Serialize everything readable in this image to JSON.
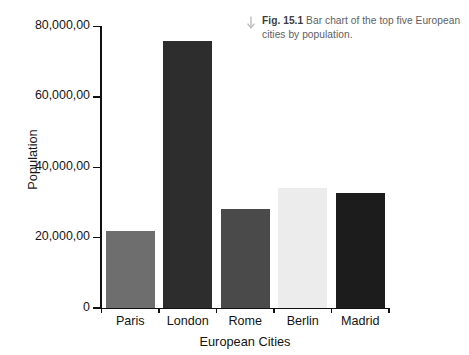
{
  "caption": {
    "icon": "down-arrow-icon",
    "label": "Fig. 15.1",
    "text": " Bar chart of the top five European cities by population."
  },
  "chart_data": {
    "type": "bar",
    "title": "",
    "categories": [
      "Paris",
      "London",
      "Rome",
      "Berlin",
      "Madrid"
    ],
    "values": [
      22000,
      76000,
      28000,
      34000,
      32800
    ],
    "bar_colors": [
      "#6e6e6e",
      "#2d2d2d",
      "#4a4a4a",
      "#ececec",
      "#1c1c1c"
    ],
    "xlabel": "European Cities",
    "ylabel": "Population",
    "ylim": [
      0,
      80000
    ],
    "ytick_values": [
      0,
      20000,
      40000,
      60000,
      80000
    ],
    "ytick_labels": [
      "0",
      "20,000,00",
      "40,000,00",
      "60,000,00",
      "80,000,00"
    ],
    "grid": false,
    "legend": "none"
  }
}
